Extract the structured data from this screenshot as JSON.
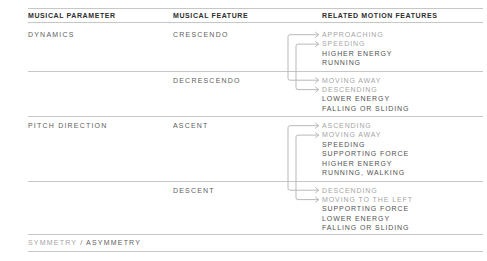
{
  "header": {
    "col1": "MUSICAL PARAMETER",
    "col2": "MUSICAL FEATURE",
    "col3": "RELATED MOTION FEATURES"
  },
  "sections": [
    {
      "parameter": "DYNAMICS",
      "features": [
        {
          "name": "CRESCENDO",
          "motions": [
            {
              "label": "APPROACHING",
              "arrow": true,
              "muted": true
            },
            {
              "label": "SPEEDING",
              "arrow": true,
              "muted": true
            },
            {
              "label": "HIGHER ENERGY",
              "arrow": false,
              "muted": false
            },
            {
              "label": "RUNNING",
              "arrow": false,
              "muted": false
            }
          ]
        },
        {
          "name": "DECRESCENDO",
          "motions": [
            {
              "label": "MOVING AWAY",
              "arrow": true,
              "muted": true
            },
            {
              "label": "DESCENDING",
              "arrow": true,
              "muted": true
            },
            {
              "label": "LOWER ENERGY",
              "arrow": false,
              "muted": false
            },
            {
              "label": "FALLING OR SLIDING",
              "arrow": false,
              "muted": false
            }
          ]
        }
      ],
      "connections": [
        {
          "from": "APPROACHING",
          "to": "MOVING AWAY"
        },
        {
          "from": "SPEEDING",
          "to": "DESCENDING"
        }
      ]
    },
    {
      "parameter": "PITCH DIRECTION",
      "features": [
        {
          "name": "ASCENT",
          "motions": [
            {
              "label": "ASCENDING",
              "arrow": true,
              "muted": true
            },
            {
              "label": "MOVING AWAY",
              "arrow": true,
              "muted": true
            },
            {
              "label": "SPEEDING",
              "arrow": false,
              "muted": false
            },
            {
              "label": "SUPPORTING FORCE",
              "arrow": false,
              "muted": false
            },
            {
              "label": "HIGHER ENERGY",
              "arrow": false,
              "muted": false
            },
            {
              "label": "RUNNING, WALKING",
              "arrow": false,
              "muted": false
            }
          ]
        },
        {
          "name": "DESCENT",
          "motions": [
            {
              "label": "DESCENDING",
              "arrow": true,
              "muted": true
            },
            {
              "label": "MOVING TO THE LEFT",
              "arrow": true,
              "muted": true
            },
            {
              "label": "SUPPORTING FORCE",
              "arrow": false,
              "muted": false
            },
            {
              "label": "LOWER ENERGY",
              "arrow": false,
              "muted": false
            },
            {
              "label": "FALLING OR SLIDING",
              "arrow": false,
              "muted": false
            }
          ]
        }
      ],
      "connections": [
        {
          "from": "ASCENDING",
          "to": "DESCENDING"
        },
        {
          "from": "MOVING AWAY",
          "to": "MOVING TO THE LEFT"
        }
      ]
    }
  ],
  "footer": {
    "symmetry": "SYMMETRY",
    "separator": "/",
    "asymmetry": "ASYMMETRY"
  },
  "colors": {
    "background": "#ffffff",
    "header_text": "#2e2e2e",
    "label_text": "#5e5e5e",
    "motion_text": "#515151",
    "muted_text": "#a5a5a5",
    "rule": "#c7c7c7",
    "connector": "#b9b9b9"
  }
}
